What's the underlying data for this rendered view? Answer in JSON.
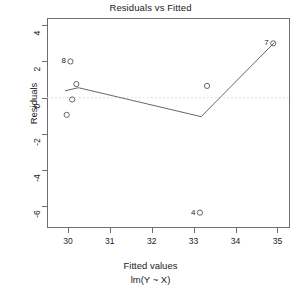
{
  "chart_data": {
    "type": "scatter",
    "title": "Residuals vs Fitted",
    "xlabel": "Fitted values",
    "xsublabel": "lm(Y ~ X)",
    "ylabel": "Residuals",
    "xlim": [
      29.5,
      35.3
    ],
    "ylim": [
      -7.2,
      4.4
    ],
    "xticks": [
      30,
      31,
      32,
      33,
      34,
      35
    ],
    "xticklabels": [
      "30",
      "31",
      "32",
      "33",
      "34",
      "35"
    ],
    "yticks": [
      4,
      2,
      0,
      -2,
      -4,
      -6
    ],
    "yticklabels": [
      "4",
      "2",
      "0",
      "-2",
      "-4",
      "-6"
    ],
    "grid": false,
    "legend": false,
    "zero_reference_line": {
      "y": 0,
      "style": "dotted",
      "color": "#d8d8d8"
    },
    "points": [
      {
        "x": 29.97,
        "y": -0.95,
        "label": ""
      },
      {
        "x": 30.06,
        "y": 2.0,
        "label": "8"
      },
      {
        "x": 30.2,
        "y": 0.75,
        "label": ""
      },
      {
        "x": 30.1,
        "y": -0.1,
        "label": ""
      },
      {
        "x": 33.15,
        "y": -6.35,
        "label": "4"
      },
      {
        "x": 33.32,
        "y": 0.65,
        "label": ""
      },
      {
        "x": 34.9,
        "y": 3.0,
        "label": "7"
      }
    ],
    "smoother": {
      "name": "loess",
      "color": "#555555",
      "points": [
        {
          "x": 29.93,
          "y": 0.38
        },
        {
          "x": 30.25,
          "y": 0.55
        },
        {
          "x": 33.18,
          "y": -1.05
        },
        {
          "x": 34.93,
          "y": 3.05
        }
      ]
    }
  }
}
